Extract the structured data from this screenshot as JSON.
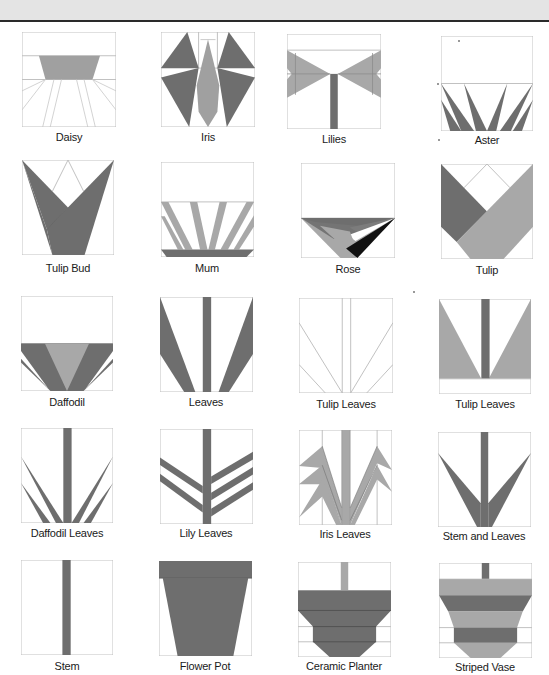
{
  "page": {
    "colors": {
      "dark": "#6e6e6e",
      "light": "#a8a8a8",
      "black": "#111111",
      "outline": "#bdbdbd",
      "background": "#ffffff",
      "banner": "#e4e4e4"
    }
  },
  "blocks": [
    {
      "name": "Daisy"
    },
    {
      "name": "Iris"
    },
    {
      "name": "Lilies"
    },
    {
      "name": "Aster"
    },
    {
      "name": "Tulip Bud"
    },
    {
      "name": "Mum"
    },
    {
      "name": "Rose"
    },
    {
      "name": "Tulip"
    },
    {
      "name": "Daffodil"
    },
    {
      "name": "Leaves"
    },
    {
      "name": "Tulip Leaves"
    },
    {
      "name": "Tulip Leaves"
    },
    {
      "name": "Daffodil Leaves"
    },
    {
      "name": "Lily Leaves"
    },
    {
      "name": "Iris Leaves"
    },
    {
      "name": "Stem and Leaves"
    },
    {
      "name": "Stem"
    },
    {
      "name": "Flower Pot"
    },
    {
      "name": "Ceramic Planter"
    },
    {
      "name": "Striped Vase"
    }
  ]
}
